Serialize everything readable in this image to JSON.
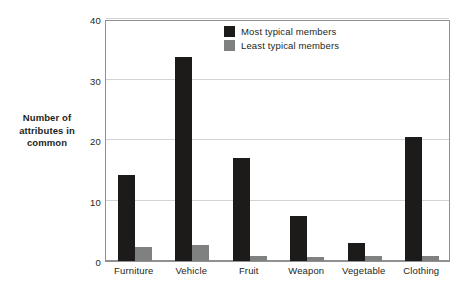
{
  "chart_data": {
    "type": "bar",
    "title": "",
    "xlabel": "",
    "ylabel": "Number of\nattributes in\ncommon",
    "ylabel_lines": [
      "Number of",
      "attributes in",
      "common"
    ],
    "ylim": [
      0,
      40
    ],
    "yticks": [
      0,
      10,
      20,
      30,
      40
    ],
    "ytick_labels": [
      "0",
      "10",
      "20",
      "30",
      "40"
    ],
    "grid": true,
    "grid_axis": "y",
    "legend_position": "upper right",
    "categories": [
      "Furniture",
      "Vehicle",
      "Fruit",
      "Weapon",
      "Vegetable",
      "Clothing"
    ],
    "series": [
      {
        "name": "Most typical members",
        "color": "#1c1b1a",
        "values": [
          14.2,
          33.8,
          17.0,
          7.5,
          3.0,
          20.5
        ]
      },
      {
        "name": "Least typical members",
        "color": "#7f8080",
        "values": [
          2.3,
          2.7,
          0.8,
          0.7,
          0.8,
          0.8
        ]
      }
    ]
  },
  "axes": {
    "y_title_lines": [
      "Number of",
      "attributes in",
      "common"
    ]
  },
  "colors": {
    "most_typical": "#1c1b1a",
    "least_typical": "#7f8080",
    "gridline": "#d2d3d4",
    "frame": "#8e9091",
    "text": "#231f20",
    "background": "#ffffff"
  }
}
